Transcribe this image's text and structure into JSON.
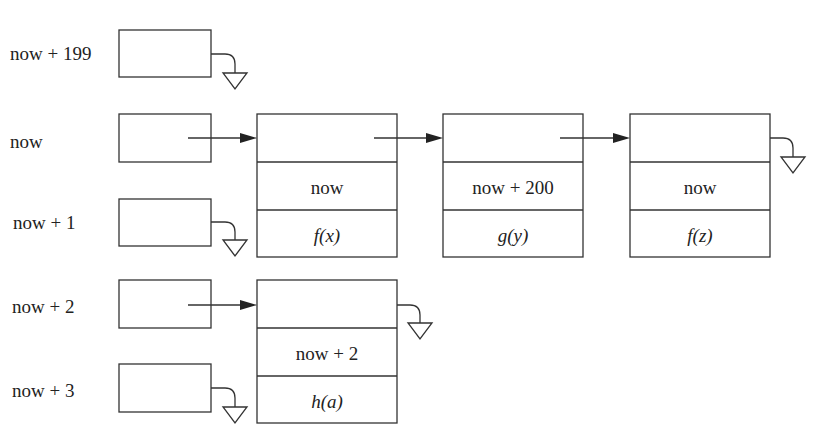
{
  "slots": [
    {
      "label": "now + 199"
    },
    {
      "label": "now"
    },
    {
      "label": "now + 1"
    },
    {
      "label": "now + 2"
    },
    {
      "label": "now + 3"
    }
  ],
  "events": [
    {
      "time": "now",
      "func": "f(x)"
    },
    {
      "time": "now + 200",
      "func": "g(y)"
    },
    {
      "time": "now",
      "func": "f(z)"
    },
    {
      "time": "now + 2",
      "func": "h(a)"
    }
  ],
  "colors": {
    "line": "#333333",
    "background": "#ffffff"
  }
}
